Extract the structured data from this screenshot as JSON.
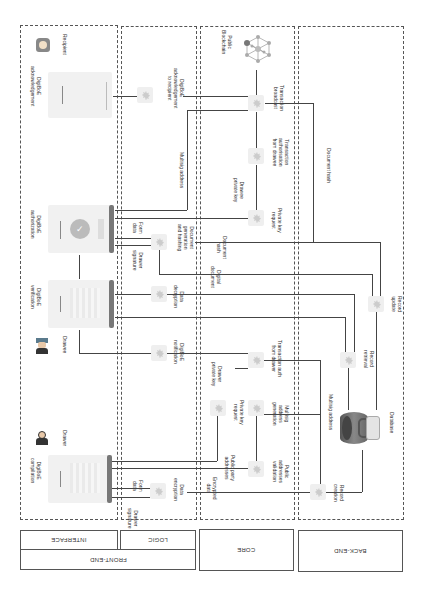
{
  "lanes": {
    "frontend": "FRONT-END",
    "interface": "INTERFACE",
    "logic": "LOGIC",
    "core": "CORE",
    "backend": "BACK-END"
  },
  "actors": {
    "recipient": "Recipient",
    "drawee": "Drawee",
    "drawer": "Drawer"
  },
  "screens": {
    "acknowledgement": "DigiBoE\nacknowledgement",
    "authorization": "DigiBoE\nauthorization",
    "verification": "DigiBoE\nverification",
    "compilation": "DigiBoE\ncompilation"
  },
  "logic_nodes": {
    "ack_to_recipient": "DigiBoE\nacknowledgement\nto recipient",
    "doc_generation": "Document\ngeneration\nand hashing",
    "data_decryption": "Data\ndecryption",
    "notification": "DigiBoE\nnotification",
    "data_encryption": "Data\nencryption"
  },
  "core_nodes": {
    "public_blockchain": "Public\nBlockchain",
    "tx_broadcast": "Transaction\nbroadcast",
    "tx_auth_drawee": "Transaction\nauthorisation\nfrom drawee",
    "private_key_request_top": "Private key\nrequest",
    "tx_auth_drawer": "Transaction auth\nfrom drawer",
    "private_key_request_bottom": "Private key\nrequest",
    "multisig_generation": "Multisig\naddress\ngeneration",
    "public_addresses_validation": "Public\naddresses\nvalidation"
  },
  "backend_nodes": {
    "record_update": "Record\nupdate",
    "record_retrieval": "Record\nretrieval",
    "database": "Database",
    "record_creation": "Record\ncreation"
  },
  "edge_labels": {
    "multisig_address_top": "Multisig address",
    "drawee_private_key": "Drawee\nprivate key",
    "document_hash_long": "Document hash",
    "form_data_top": "Form\ndata",
    "drawer_signature_top": "Drawer\nsignature",
    "document_hash": "Document\nhash",
    "digital_document": "Digital\ndocument",
    "drawer_private_key": "Drawer\nprivate key",
    "multisig_address_bottom": "Multisig address",
    "public_party_addresses": "Public party\naddresses",
    "encrypted_data": "Encrypted\ndata",
    "form_data_bottom": "Form\ndata",
    "drawer_signature_bottom": "Drawer\nsignature"
  },
  "colors": {
    "node_bg": "#efefef",
    "line": "#444444",
    "screen_bar": "#777777"
  }
}
